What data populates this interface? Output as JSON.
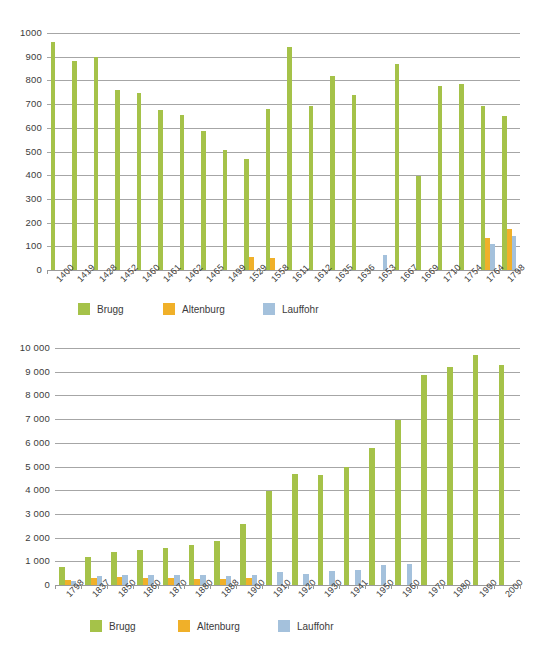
{
  "page": {
    "background": "#ffffff",
    "series_colors": {
      "brugg": "#a5c249",
      "altenburg": "#f0b029",
      "lauffohr": "#a4c1dc"
    }
  },
  "chart_data": [
    {
      "type": "bar",
      "title": "",
      "xlabel": "",
      "ylabel": "",
      "ylim": [
        0,
        1000
      ],
      "ytick_step": 100,
      "ytick_labels": [
        "1000",
        "900",
        "800",
        "700",
        "600",
        "500",
        "400",
        "300",
        "200",
        "100",
        "0"
      ],
      "grid": true,
      "legend_position": "bottom",
      "categories": [
        "1400",
        "1419",
        "1428",
        "1452",
        "1460",
        "1461",
        "1462",
        "1465",
        "1499",
        "1529",
        "1558",
        "1611",
        "1612",
        "1635",
        "1636",
        "1653",
        "1667",
        "1669",
        "1710",
        "1754",
        "1764",
        "1798"
      ],
      "series": [
        {
          "name": "Brugg",
          "color": "#a5c249",
          "values": [
            960,
            880,
            898,
            760,
            745,
            675,
            655,
            585,
            505,
            470,
            680,
            940,
            690,
            820,
            740,
            0,
            870,
            395,
            775,
            785,
            690,
            650
          ]
        },
        {
          "name": "Altenburg",
          "color": "#f0b029",
          "values": [
            0,
            0,
            0,
            0,
            0,
            0,
            0,
            0,
            0,
            55,
            50,
            0,
            0,
            0,
            0,
            0,
            0,
            0,
            0,
            0,
            135,
            175
          ]
        },
        {
          "name": "Lauffohr",
          "color": "#a4c1dc",
          "values": [
            0,
            0,
            0,
            0,
            0,
            0,
            0,
            0,
            0,
            0,
            0,
            0,
            0,
            0,
            0,
            65,
            0,
            0,
            0,
            0,
            110,
            145
          ]
        }
      ]
    },
    {
      "type": "bar",
      "title": "",
      "xlabel": "",
      "ylabel": "",
      "ylim": [
        0,
        10000
      ],
      "ytick_step": 1000,
      "ytick_labels": [
        "10 000",
        "9 000",
        "8 000",
        "7 000",
        "6 000",
        "5 000",
        "4 000",
        "3 000",
        "2 000",
        "1 000",
        "0"
      ],
      "grid": true,
      "legend_position": "bottom",
      "categories": [
        "1798",
        "1837",
        "1850",
        "1860",
        "1870",
        "1880",
        "1888",
        "1900",
        "1910",
        "1920",
        "1930",
        "1941",
        "1950",
        "1960",
        "1970",
        "1980",
        "1990",
        "2000"
      ],
      "series": [
        {
          "name": "Brugg",
          "color": "#a5c249",
          "values": [
            770,
            1180,
            1400,
            1460,
            1550,
            1670,
            1850,
            2580,
            3960,
            4680,
            4660,
            5000,
            5770,
            6950,
            8880,
            9200,
            9700,
            9270
          ]
        },
        {
          "name": "Altenburg",
          "color": "#f0b029",
          "values": [
            215,
            290,
            320,
            290,
            290,
            270,
            260,
            290,
            0,
            0,
            0,
            0,
            0,
            0,
            0,
            0,
            0,
            0
          ]
        },
        {
          "name": "Lauffohr",
          "color": "#a4c1dc",
          "values": [
            170,
            365,
            425,
            430,
            425,
            420,
            400,
            410,
            550,
            480,
            600,
            620,
            840,
            880,
            0,
            0,
            0,
            0
          ]
        }
      ]
    }
  ],
  "legend": {
    "items": [
      {
        "label": "Brugg",
        "swatch": "s0"
      },
      {
        "label": "Altenburg",
        "swatch": "s1"
      },
      {
        "label": "Lauffohr",
        "swatch": "s2"
      }
    ]
  }
}
